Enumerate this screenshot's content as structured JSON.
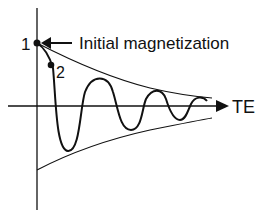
{
  "diagram": {
    "title": "",
    "labels": {
      "point1": "1",
      "point2": "2",
      "initial_magnetization": "Initial magnetization",
      "x_axis": "TE"
    },
    "elements": {
      "vertical_axis": "signal axis",
      "horizontal_axis": "TE axis with arrowhead",
      "upper_envelope": "decaying envelope (positive)",
      "lower_envelope": "decaying envelope (negative)",
      "oscillation": "damped oscillating signal",
      "arrow": "arrow pointing left to point 1"
    },
    "colors": {
      "stroke": "#111111",
      "background": "#ffffff"
    }
  }
}
